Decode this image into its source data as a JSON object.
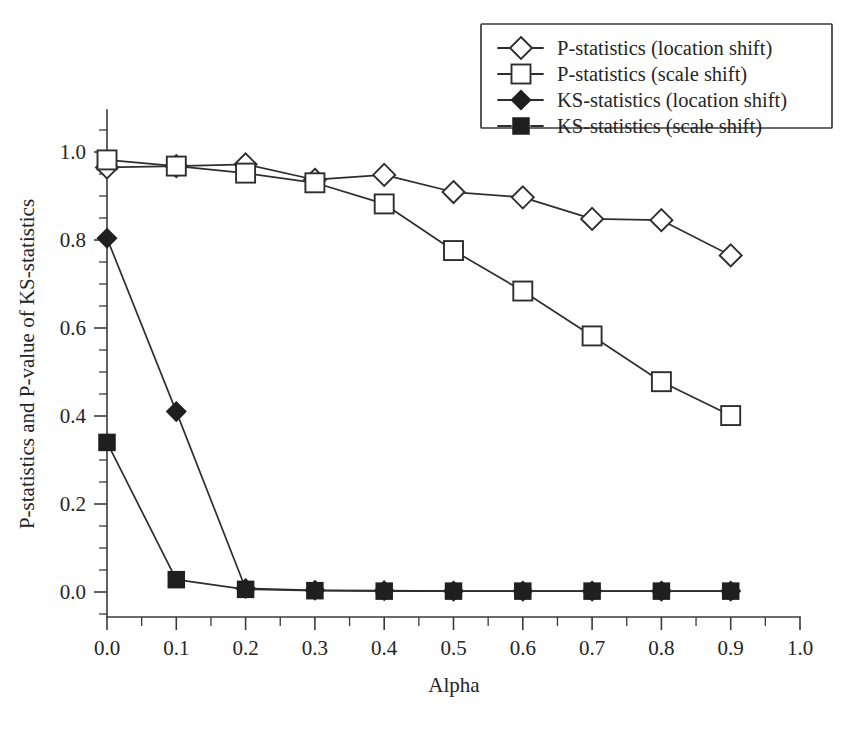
{
  "chart_data": {
    "type": "line",
    "title": "",
    "xlabel": "Alpha",
    "ylabel": "P-statistics and P-value of KS-statistics",
    "ylabel_parts": [
      {
        "text": "P-statistics and ",
        "style": "normal"
      },
      {
        "text": "P",
        "style": "italic"
      },
      {
        "text": "-value of KS-statistics",
        "style": "normal"
      }
    ],
    "x": [
      0.0,
      0.1,
      0.2,
      0.3,
      0.4,
      0.5,
      0.6,
      0.7,
      0.8,
      0.9
    ],
    "xlim": [
      0.0,
      1.0
    ],
    "ylim": [
      0.0,
      1.0
    ],
    "x_ticks": [
      "0.0",
      "0.1",
      "0.2",
      "0.3",
      "0.4",
      "0.5",
      "0.6",
      "0.7",
      "0.8",
      "0.9",
      "1.0"
    ],
    "y_ticks": [
      "0.0",
      "0.2",
      "0.4",
      "0.6",
      "0.8",
      "1.0"
    ],
    "x_minor_interval": 0.05,
    "y_minor_interval": 0.05,
    "grid": false,
    "legend_position": "top-right",
    "series": [
      {
        "name": "P-statistics (location shift)",
        "marker": "diamond-open",
        "values": [
          0.965,
          0.968,
          0.972,
          0.937,
          0.948,
          0.909,
          0.897,
          0.848,
          0.845,
          0.765
        ]
      },
      {
        "name": "P-statistics (scale shift)",
        "marker": "square-open",
        "values": [
          0.982,
          0.968,
          0.952,
          0.93,
          0.882,
          0.776,
          0.684,
          0.582,
          0.478,
          0.401
        ]
      },
      {
        "name": "KS-statistics (location shift)",
        "marker": "diamond-filled",
        "values": [
          0.804,
          0.41,
          0.008,
          0.004,
          0.003,
          0.002,
          0.002,
          0.002,
          0.002,
          0.002
        ]
      },
      {
        "name": "KS-statistics (scale shift)",
        "marker": "square-filled",
        "values": [
          0.34,
          0.028,
          0.006,
          0.003,
          0.002,
          0.002,
          0.002,
          0.002,
          0.002,
          0.002
        ]
      }
    ],
    "colors": {
      "line": "#2e2e2e",
      "marker_fill_open": "#ffffff",
      "marker_fill_closed": "#1f1f1f",
      "axis": "#3a3a3a",
      "text": "#252525",
      "background": "#ffffff"
    }
  },
  "legend": {
    "entries": [
      {
        "label": "P-statistics (location shift)",
        "marker": "diamond-open"
      },
      {
        "label": "P-statistics (scale shift)",
        "marker": "square-open"
      },
      {
        "label": "KS-statistics (location shift)",
        "marker": "diamond-filled"
      },
      {
        "label": "KS-statistics (scale shift)",
        "marker": "square-filled"
      }
    ]
  }
}
